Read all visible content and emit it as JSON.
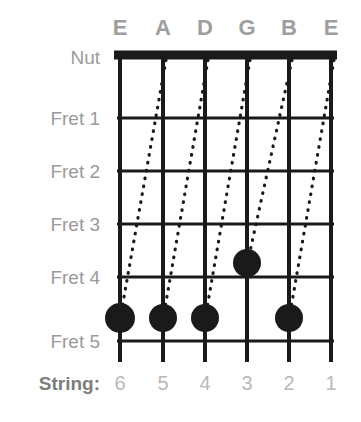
{
  "diagram": {
    "colors": {
      "ink": "#1a1a1a",
      "label_gray": "#9a9a9a",
      "note_gray": "#9e9e9e",
      "number_gray": "#b9b9b9",
      "string_word_gray": "#7d7d7d",
      "background": "#ffffff"
    },
    "string_notes": [
      {
        "label": "E",
        "x": 120
      },
      {
        "label": "A",
        "x": 163
      },
      {
        "label": "D",
        "x": 205
      },
      {
        "label": "G",
        "x": 247
      },
      {
        "label": "B",
        "x": 289
      },
      {
        "label": "E",
        "x": 331
      }
    ],
    "note_row_y": 28,
    "fret_labels": [
      {
        "label": "Nut",
        "y": 57
      },
      {
        "label": "Fret 1",
        "y": 118
      },
      {
        "label": "Fret 2",
        "y": 171
      },
      {
        "label": "Fret 3",
        "y": 224
      },
      {
        "label": "Fret 4",
        "y": 277
      },
      {
        "label": "Fret 5",
        "y": 341
      }
    ],
    "fret_label_right_x": 100,
    "nut": {
      "y": 55,
      "thickness": 9,
      "x1": 117,
      "x2": 334
    },
    "fret_lines": [
      {
        "y": 118
      },
      {
        "y": 171
      },
      {
        "y": 224
      },
      {
        "y": 277
      },
      {
        "y": 341
      }
    ],
    "string_lines": {
      "top": 55,
      "bottom": 362,
      "width": 4
    },
    "string_row": {
      "word": "String:",
      "word_right_x": 100,
      "y": 383,
      "numbers": [
        {
          "label": "6",
          "x": 120
        },
        {
          "label": "5",
          "x": 163
        },
        {
          "label": "4",
          "x": 205
        },
        {
          "label": "3",
          "x": 247
        },
        {
          "label": "2",
          "x": 289
        },
        {
          "label": "1",
          "x": 331
        }
      ]
    },
    "dots": [
      {
        "name": "dot-string-6-fret-5",
        "string": 6,
        "fret": 5,
        "cx": 120,
        "cy": 318,
        "r": 15
      },
      {
        "name": "dot-string-5-fret-5",
        "string": 5,
        "fret": 5,
        "cx": 163,
        "cy": 318,
        "r": 14
      },
      {
        "name": "dot-string-4-fret-5",
        "string": 4,
        "fret": 5,
        "cx": 205,
        "cy": 318,
        "r": 14
      },
      {
        "name": "dot-string-3-fret-4",
        "string": 3,
        "fret": 4,
        "cx": 247,
        "cy": 263,
        "r": 14
      },
      {
        "name": "dot-string-2-fret-5",
        "string": 2,
        "fret": 5,
        "cx": 289,
        "cy": 318,
        "r": 14
      }
    ],
    "slide_lines": [
      {
        "name": "slide-6-to-5",
        "x1": 166,
        "y1": 60,
        "x2": 122,
        "y2": 308
      },
      {
        "name": "slide-5-to-4",
        "x1": 208,
        "y1": 60,
        "x2": 165,
        "y2": 308
      },
      {
        "name": "slide-4-to-3",
        "x1": 250,
        "y1": 60,
        "x2": 207,
        "y2": 308
      },
      {
        "name": "slide-3-to-2",
        "x1": 292,
        "y1": 60,
        "x2": 249,
        "y2": 256
      },
      {
        "name": "slide-2-to-1",
        "x1": 334,
        "y1": 60,
        "x2": 291,
        "y2": 308
      }
    ]
  }
}
